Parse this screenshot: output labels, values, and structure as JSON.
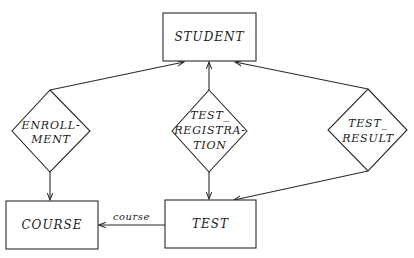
{
  "diagram": {
    "type": "entity-relationship",
    "entities": [
      {
        "id": "student",
        "label": "STUDENT",
        "x": 163,
        "y": 13,
        "w": 93,
        "h": 48
      },
      {
        "id": "course",
        "label": "COURSE",
        "x": 6,
        "y": 201,
        "w": 92,
        "h": 48
      },
      {
        "id": "test",
        "label": "TEST",
        "x": 165,
        "y": 200,
        "w": 91,
        "h": 48
      }
    ],
    "relationships": [
      {
        "id": "enrollment",
        "lines": [
          "ENROLL-",
          "MENT"
        ],
        "cx": 51,
        "cy": 131,
        "top": 90,
        "bottom": 172,
        "left": 12,
        "right": 90
      },
      {
        "id": "test-registration",
        "lines": [
          "TEST_",
          "REGISTRA-",
          "TION"
        ],
        "cx": 209,
        "cy": 131,
        "top": 90,
        "bottom": 172,
        "left": 172,
        "right": 247
      },
      {
        "id": "test-result",
        "lines": [
          "TEST_",
          "RESULT"
        ],
        "cx": 368,
        "cy": 130,
        "top": 89,
        "bottom": 171,
        "left": 328,
        "right": 407
      }
    ],
    "edges": [
      {
        "from": "enrollment",
        "to": "student",
        "label": ""
      },
      {
        "from": "enrollment",
        "to": "course",
        "label": ""
      },
      {
        "from": "test-registration",
        "to": "student",
        "label": ""
      },
      {
        "from": "test-registration",
        "to": "test",
        "label": ""
      },
      {
        "from": "test-result",
        "to": "student",
        "label": ""
      },
      {
        "from": "test-result",
        "to": "test",
        "label": ""
      },
      {
        "from": "test",
        "to": "course",
        "label": "course"
      }
    ],
    "labels": {
      "student": "STUDENT",
      "course": "COURSE",
      "test": "TEST",
      "enrollment_1": "ENROLL-",
      "enrollment_2": "MENT",
      "test_registration_1": "TEST_",
      "test_registration_2": "REGISTRA-",
      "test_registration_3": "TION",
      "test_result_1": "TEST_",
      "test_result_2": "RESULT",
      "edge_course": "course"
    }
  }
}
